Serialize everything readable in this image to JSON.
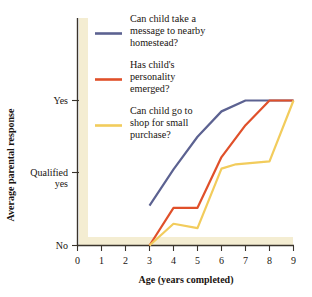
{
  "chart_data": {
    "type": "line",
    "title": "",
    "xlabel": "Age (years completed)",
    "ylabel": "Average parental response",
    "xlim": [
      0,
      9
    ],
    "ylim": [
      0,
      2
    ],
    "grid": false,
    "legend_position": "upper-left-inside",
    "x_tick_labels": [
      "0",
      "1",
      "2",
      "3",
      "4",
      "5",
      "6",
      "7",
      "8",
      "9"
    ],
    "x_ticks": [
      0,
      1,
      2,
      3,
      4,
      5,
      6,
      7,
      8,
      9
    ],
    "y_tick_labels": [
      "Yes",
      "Qualified yes",
      "No"
    ],
    "y_ticks": [
      2,
      1,
      0
    ],
    "series": [
      {
        "name": "Can child take a message to nearby homestead?",
        "color": "#5c6291",
        "x": [
          3,
          4,
          5,
          6,
          7,
          8,
          9
        ],
        "values": [
          0.55,
          1.05,
          1.5,
          1.85,
          2.0,
          2.0,
          2.0
        ]
      },
      {
        "name": "Has child's personality emerged?",
        "color": "#e0502a",
        "x": [
          3,
          4,
          5,
          6,
          7,
          8,
          9
        ],
        "values": [
          0.0,
          0.52,
          0.52,
          1.22,
          1.66,
          2.0,
          2.0
        ]
      },
      {
        "name": "Can child go to shop for small purchase?",
        "color": "#f0c košt"
      }
    ]
  },
  "legend": {
    "items": [
      {
        "color": "#5c6291",
        "lines": [
          "Can child take a",
          "message to nearby",
          "homestead?"
        ]
      },
      {
        "color": "#e0502a",
        "lines": [
          "Has child's",
          "personality",
          "emerged?"
        ]
      },
      {
        "color": "#f2cc5c",
        "lines": [
          "Can child go to",
          "shop for small",
          "purchase?"
        ]
      }
    ]
  },
  "axes": {
    "x_title": "Age (years completed)",
    "y_title": "Average parental response",
    "x_tick_labels": [
      "0",
      "1",
      "2",
      "3",
      "4",
      "5",
      "6",
      "7",
      "8",
      "9"
    ],
    "y_tick_labels": {
      "top": "Yes",
      "middle_line1": "Qualified",
      "middle_line2": "yes",
      "bottom": "No"
    }
  },
  "colors": {
    "blue": "#5c6291",
    "red": "#e0502a",
    "yellow": "#f2cc5c",
    "band": "#f4edd2",
    "axis": "#3a342c"
  }
}
